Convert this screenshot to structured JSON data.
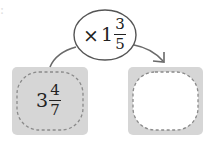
{
  "operator": {
    "symbol": "×",
    "whole": "1",
    "numerator": "3",
    "denominator": "5"
  },
  "start_value": {
    "whole": "3",
    "numerator": "4",
    "denominator": "7"
  },
  "result_value": {
    "whole": "",
    "numerator": "",
    "denominator": ""
  },
  "colors": {
    "box_fill": "#d6d6d6",
    "dash": "#8a8a8a",
    "line": "#6a6a6a",
    "result_inner": "#ffffff"
  }
}
